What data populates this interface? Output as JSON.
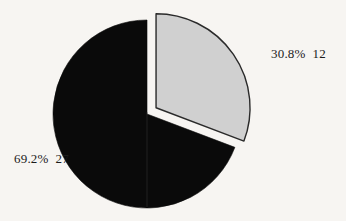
{
  "chart_data": {
    "type": "pie",
    "title": "",
    "subtitle": "",
    "xlabel": "",
    "ylabel": "",
    "legend_position": "none",
    "grid": false,
    "total": 39,
    "start_angle_deg": 0,
    "direction": "clockwise",
    "categories": [
      "30.8%  12",
      "69.2%  27"
    ],
    "values": [
      12,
      27
    ],
    "percentages": [
      30.8,
      69.2
    ],
    "slices": [
      {
        "label": "30.8%  12",
        "percent_text": "30.8%",
        "count_text": "12",
        "value": 12,
        "percent": 30.8,
        "color": "#d0d0d0",
        "outline_color": "#2a2a2a",
        "exploded": true,
        "label_position": "right"
      },
      {
        "label": "69.2%  27",
        "percent_text": "69.2%",
        "count_text": "27",
        "value": 27,
        "percent": 69.2,
        "color": "#0a0a0a",
        "outline_color": "#0a0a0a",
        "exploded": false,
        "label_position": "left"
      }
    ],
    "annotations": [
      {
        "text": "30.8%  12",
        "x": 271,
        "y": 47
      },
      {
        "text": "69.2%  27",
        "x": 14,
        "y": 152
      }
    ]
  },
  "figure": {
    "background_color": "#f7f5f2",
    "text_color": "#1b1b1b",
    "center_x": 147,
    "center_y": 114,
    "radius": 94,
    "explode_offset": 11
  }
}
